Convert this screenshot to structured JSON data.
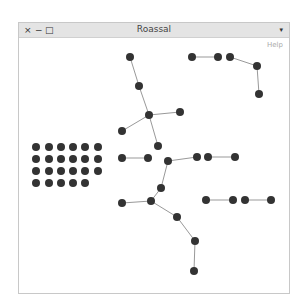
{
  "window": {
    "title": "Roassal",
    "controls": {
      "close": "×",
      "minimize": "−",
      "maximize": "□"
    },
    "menu_arrow": "▾",
    "help_label": "Help"
  },
  "graph": {
    "node_color": "#333333",
    "edge_color": "#999999",
    "node_radius": 4,
    "nodes": [
      {
        "id": "a1",
        "x": 130,
        "y": 57
      },
      {
        "id": "a2",
        "x": 139,
        "y": 86
      },
      {
        "id": "a3",
        "x": 149,
        "y": 115
      },
      {
        "id": "a4",
        "x": 180,
        "y": 112
      },
      {
        "id": "a5",
        "x": 122,
        "y": 131
      },
      {
        "id": "a6",
        "x": 158,
        "y": 146
      },
      {
        "id": "b1",
        "x": 192,
        "y": 57
      },
      {
        "id": "b2",
        "x": 218,
        "y": 57
      },
      {
        "id": "b3",
        "x": 230,
        "y": 57
      },
      {
        "id": "b4",
        "x": 257,
        "y": 66
      },
      {
        "id": "b5",
        "x": 259,
        "y": 94
      },
      {
        "id": "c1",
        "x": 122,
        "y": 158
      },
      {
        "id": "c2",
        "x": 148,
        "y": 158
      },
      {
        "id": "d1",
        "x": 168,
        "y": 161
      },
      {
        "id": "d2",
        "x": 197,
        "y": 157
      },
      {
        "id": "d3",
        "x": 161,
        "y": 188
      },
      {
        "id": "d4",
        "x": 151,
        "y": 201
      },
      {
        "id": "d5",
        "x": 122,
        "y": 203
      },
      {
        "id": "d6",
        "x": 177,
        "y": 217
      },
      {
        "id": "d7",
        "x": 195,
        "y": 241
      },
      {
        "id": "d8",
        "x": 194,
        "y": 271
      },
      {
        "id": "e1",
        "x": 208,
        "y": 157
      },
      {
        "id": "e2",
        "x": 235,
        "y": 157
      },
      {
        "id": "f1",
        "x": 206,
        "y": 200
      },
      {
        "id": "f2",
        "x": 233,
        "y": 200
      },
      {
        "id": "g1",
        "x": 245,
        "y": 200
      },
      {
        "id": "g2",
        "x": 271,
        "y": 200
      }
    ],
    "edges": [
      [
        "a1",
        "a2"
      ],
      [
        "a2",
        "a3"
      ],
      [
        "a3",
        "a4"
      ],
      [
        "a3",
        "a5"
      ],
      [
        "a3",
        "a6"
      ],
      [
        "b1",
        "b2"
      ],
      [
        "b3",
        "b4"
      ],
      [
        "b4",
        "b5"
      ],
      [
        "c1",
        "c2"
      ],
      [
        "d1",
        "d2"
      ],
      [
        "d1",
        "d3"
      ],
      [
        "d3",
        "d4"
      ],
      [
        "d4",
        "d5"
      ],
      [
        "d4",
        "d6"
      ],
      [
        "d6",
        "d7"
      ],
      [
        "d7",
        "d8"
      ],
      [
        "e1",
        "e2"
      ],
      [
        "f1",
        "f2"
      ],
      [
        "g1",
        "g2"
      ]
    ],
    "grid": {
      "columns_x": [
        36,
        49,
        61,
        73,
        85,
        98
      ],
      "rows_y": [
        147,
        159,
        171,
        183
      ],
      "row_counts": [
        6,
        6,
        6,
        5
      ]
    }
  }
}
